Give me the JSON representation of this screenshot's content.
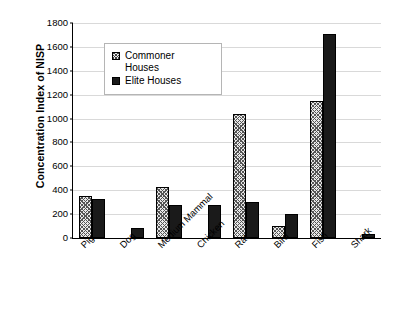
{
  "chart_data": {
    "type": "bar",
    "title": "",
    "subtitle": "",
    "xlabel": "",
    "ylabel": "Concentration Index of NISP",
    "ylim": [
      0,
      1800
    ],
    "ytick_step": 200,
    "yticks": [
      0,
      200,
      400,
      600,
      800,
      1000,
      1200,
      1400,
      1600,
      1800
    ],
    "ytick_labels": [
      "0",
      "200",
      "400",
      "600",
      "800",
      "1000",
      "1200",
      "1400",
      "1600",
      "1800"
    ],
    "grid": "horizontal",
    "legend_position": "upper-left-inside",
    "categories": [
      "Pig",
      "Dog",
      "Medium Mammal",
      "Chicken",
      "Rat",
      "Bird",
      "Fish",
      "Shark"
    ],
    "series": [
      {
        "name": "Commoner Houses",
        "swatch": "hatched-square",
        "values": [
          350,
          0,
          425,
          0,
          1035,
          100,
          1145,
          0
        ]
      },
      {
        "name": "Elite Houses",
        "swatch": "filled-square",
        "values": [
          330,
          85,
          275,
          280,
          300,
          200,
          1705,
          30
        ]
      }
    ]
  },
  "legend": {
    "entries": [
      {
        "label": "Commoner\nHouses"
      },
      {
        "label": "Elite Houses"
      }
    ]
  },
  "colors": {
    "commoner_fill": "#e8e8e8",
    "elite_fill": "#1a1a1a",
    "axis": "#000000",
    "gridline": "#d9d9d9",
    "background": "#ffffff"
  }
}
